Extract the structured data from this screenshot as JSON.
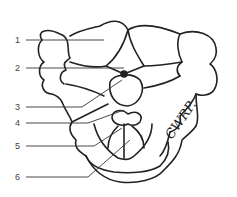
{
  "figure": {
    "type": "anatomical line drawing",
    "labels": [
      {
        "number": "1",
        "x": 15,
        "y": 40
      },
      {
        "number": "2",
        "x": 15,
        "y": 68
      },
      {
        "number": "3",
        "x": 15,
        "y": 107
      },
      {
        "number": "4",
        "x": 15,
        "y": 123
      },
      {
        "number": "5",
        "x": 15,
        "y": 146
      },
      {
        "number": "6",
        "x": 15,
        "y": 177
      }
    ],
    "signature": "CWRP."
  },
  "colors": {
    "line": "#222222",
    "background": "#ffffff"
  }
}
